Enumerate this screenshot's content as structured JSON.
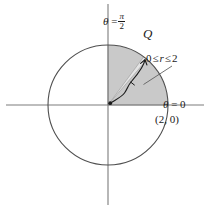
{
  "figure": {
    "background_color": "#ffffff",
    "width": 210,
    "height": 209
  },
  "colors": {
    "axis": "#7c7c7c",
    "circle_stroke": "#4f4f4f",
    "region_fill": "#c9c9c9",
    "region_stroke": "#707070",
    "ray_fill": "#e2e2e2",
    "ray_stroke": "#8a8a8a",
    "annotation_ink": "#1a1a1a",
    "leader_line": "#5a5a5a",
    "text": "#1a1a1a"
  },
  "geometry": {
    "origin": {
      "x": 108,
      "y": 105
    },
    "circle_radius": 60,
    "region_start_angle_deg": 0,
    "region_end_angle_deg": 90,
    "ray_angle_deg": 52,
    "ray_half_width_deg": 3.2,
    "unit_radius_label": 2
  },
  "labels": {
    "theta_half_pi": {
      "name": "theta-equals-pi-over-two",
      "symbol": "θ",
      "equals": " =",
      "numerator": "π",
      "denominator": "2"
    },
    "region_q": {
      "name": "region-label-q",
      "text": "Q"
    },
    "r_range": {
      "name": "r-range-inequality",
      "lower": "0",
      "rel_left": "≤",
      "variable": "r",
      "rel_right": "≤",
      "upper": "2"
    },
    "theta_zero": {
      "name": "theta-equals-zero",
      "symbol": "θ",
      "equals": " = 0"
    },
    "point_two_zero": {
      "name": "point-two-comma-zero",
      "text": "(2, 0)"
    }
  },
  "axes": {
    "horizontal": {
      "label": "polar axis",
      "y": 105,
      "x_start": 6,
      "x_end": 204
    },
    "vertical": {
      "label": "theta = pi/2 axis",
      "x": 108,
      "y_start": 4,
      "y_end": 205
    }
  },
  "annotations": {
    "origin_dot": {
      "name": "origin-dot",
      "radius": 1.9
    },
    "ray_arrow": {
      "name": "hand-drawn-ray-arrow",
      "description": "hand-drawn arrow along the ray of constant theta"
    },
    "leader": {
      "name": "leader-line-to-r-range",
      "description": "leader line from the 0 <= r <= 2 text to the ray"
    }
  }
}
